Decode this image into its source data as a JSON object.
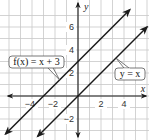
{
  "chart_data": {
    "type": "line",
    "title": "",
    "xlabel": "x",
    "ylabel": "y",
    "xlim": [
      -6.7,
      6
    ],
    "ylim": [
      -3.6,
      8.2
    ],
    "grid": true,
    "x_ticks": [
      {
        "value": -4,
        "label": "−4"
      },
      {
        "value": -2,
        "label": "−2"
      },
      {
        "value": 2,
        "label": "2"
      },
      {
        "value": 4,
        "label": "4"
      }
    ],
    "y_ticks": [
      {
        "value": -2,
        "label": "−2"
      },
      {
        "value": 2,
        "label": "2"
      },
      {
        "value": 4,
        "label": "4"
      },
      {
        "value": 6,
        "label": "6"
      }
    ],
    "series": [
      {
        "name": "f(x) = x + 3",
        "equation": "f(x) = x + 3",
        "slope": 1,
        "intercept": 3,
        "x": [
          -6.3,
          4.5
        ],
        "y": [
          -3.3,
          7.5
        ],
        "color": "#1a1a1a",
        "arrows": "both",
        "callout": {
          "text": "f(x) = x + 3",
          "anchor_x": -1.6,
          "anchor_y": 1.4
        }
      },
      {
        "name": "y = x",
        "equation": "y = x",
        "slope": 1,
        "intercept": 0,
        "x": [
          -3.5,
          6.0
        ],
        "y": [
          -3.5,
          6.0
        ],
        "color": "#1a1a1a",
        "arrows": "both",
        "callout": {
          "text": "y = x",
          "anchor_x": 3.3,
          "anchor_y": 3.3
        }
      }
    ],
    "legend": "callouts"
  },
  "style": {
    "grid_color": "#c8c8c8",
    "axis_color": "#1a1a1a",
    "line_color": "#1a1a1a",
    "callout_border": "#555555",
    "callout_bg": "#ffffff"
  }
}
